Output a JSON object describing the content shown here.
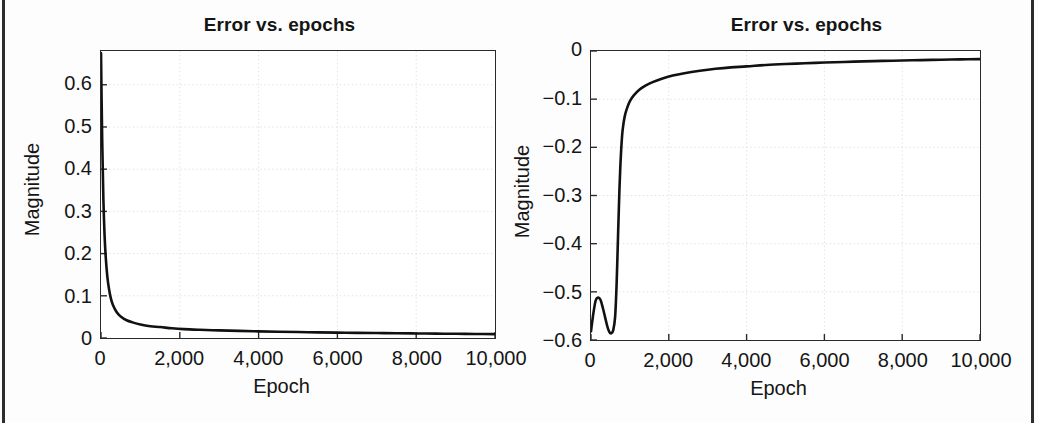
{
  "figure": {
    "background": "#ffffff",
    "ink_color": "#151515",
    "curve_color": "#111111",
    "grid_color": "#e2e2e2",
    "axis_color": "#2a2a2a",
    "page_rule_color": "#2c2c2c"
  },
  "chart_data": [
    {
      "type": "line",
      "panel": "left",
      "title": "Error vs. epochs",
      "xlabel": "Epoch",
      "ylabel": "Magnitude",
      "xlim": [
        0,
        10000
      ],
      "ylim": [
        0,
        0.68
      ],
      "xticks": [
        0,
        2000,
        4000,
        6000,
        8000,
        10000
      ],
      "xticklabels": [
        "0",
        "2,000",
        "4,000",
        "6,000",
        "8,000",
        "10,000"
      ],
      "yticks": [
        0,
        0.1,
        0.2,
        0.3,
        0.4,
        0.5,
        0.6
      ],
      "yticklabels": [
        "0",
        "0.1",
        "0.2",
        "0.3",
        "0.4",
        "0.5",
        "0.6"
      ],
      "grid": true,
      "legend": null,
      "series": [
        {
          "name": "error",
          "x": [
            0,
            30,
            60,
            90,
            120,
            160,
            200,
            250,
            300,
            400,
            500,
            650,
            800,
            1000,
            1250,
            1500,
            1800,
            2100,
            2500,
            3000,
            3500,
            4000,
            4500,
            5000,
            5500,
            6000,
            6500,
            7000,
            7500,
            8000,
            8500,
            9000,
            9500,
            10000
          ],
          "y": [
            0.675,
            0.47,
            0.33,
            0.245,
            0.192,
            0.146,
            0.118,
            0.094,
            0.079,
            0.061,
            0.051,
            0.042,
            0.037,
            0.032,
            0.028,
            0.026,
            0.023,
            0.021,
            0.0195,
            0.018,
            0.0168,
            0.0158,
            0.0149,
            0.0141,
            0.0134,
            0.0128,
            0.0122,
            0.0117,
            0.0112,
            0.0108,
            0.0104,
            0.01,
            0.0096,
            0.0092
          ]
        }
      ]
    },
    {
      "type": "line",
      "panel": "right",
      "title": "Error vs. epochs",
      "xlabel": "Epoch",
      "ylabel": "Magnitude",
      "xlim": [
        0,
        10000
      ],
      "ylim": [
        -0.6,
        0.0
      ],
      "xticks": [
        0,
        2000,
        4000,
        6000,
        8000,
        10000
      ],
      "xticklabels": [
        "0",
        "2,000",
        "4,000",
        "6,000",
        "8,000",
        "10,000"
      ],
      "yticks": [
        0,
        -0.1,
        -0.2,
        -0.3,
        -0.4,
        -0.5,
        -0.6
      ],
      "yticklabels": [
        "0",
        "−0.1",
        "−0.2",
        "−0.3",
        "−0.4",
        "−0.5",
        "−0.6"
      ],
      "grid": true,
      "legend": null,
      "series": [
        {
          "name": "error",
          "x": [
            0,
            60,
            120,
            180,
            240,
            300,
            360,
            420,
            470,
            520,
            570,
            620,
            660,
            700,
            730,
            760,
            800,
            840,
            880,
            930,
            1000,
            1100,
            1250,
            1400,
            1600,
            1800,
            2100,
            2400,
            2800,
            3200,
            3600,
            4000,
            4500,
            5000,
            5500,
            6000,
            6500,
            7000,
            7500,
            8000,
            8500,
            9000,
            9500,
            10000
          ],
          "y": [
            -0.582,
            -0.545,
            -0.518,
            -0.512,
            -0.516,
            -0.532,
            -0.552,
            -0.572,
            -0.583,
            -0.586,
            -0.58,
            -0.552,
            -0.48,
            -0.37,
            -0.29,
            -0.23,
            -0.175,
            -0.148,
            -0.131,
            -0.118,
            -0.104,
            -0.092,
            -0.08,
            -0.072,
            -0.064,
            -0.058,
            -0.051,
            -0.046,
            -0.041,
            -0.037,
            -0.034,
            -0.032,
            -0.029,
            -0.027,
            -0.0255,
            -0.024,
            -0.0228,
            -0.0216,
            -0.0206,
            -0.0197,
            -0.0189,
            -0.0181,
            -0.0174,
            -0.0168
          ]
        }
      ]
    }
  ]
}
